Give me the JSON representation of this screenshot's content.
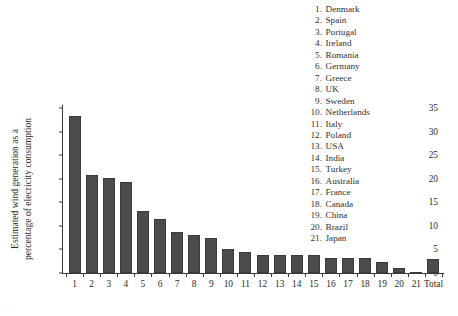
{
  "chart_data": {
    "type": "bar",
    "title": "",
    "xlabel": "",
    "ylabel": "Estimated wind generation as a percentage of elecricity consumption",
    "ylabel_lines": [
      "Estimated wind generation as a",
      "percentage of elecricity consumption"
    ],
    "categories": [
      "1",
      "2",
      "3",
      "4",
      "5",
      "6",
      "7",
      "8",
      "9",
      "10",
      "11",
      "12",
      "13",
      "14",
      "15",
      "16",
      "17",
      "18",
      "19",
      "20",
      "21",
      "Total"
    ],
    "values": [
      33.3,
      20.8,
      20.2,
      19.4,
      13.1,
      11.4,
      8.6,
      8.0,
      7.4,
      5.1,
      4.5,
      3.8,
      3.8,
      3.8,
      3.8,
      3.2,
      3.1,
      3.1,
      2.4,
      1.1,
      0.3,
      2.9
    ],
    "ylim": [
      0,
      35
    ],
    "yticks": [
      0,
      5,
      10,
      15,
      20,
      25,
      30,
      35
    ],
    "ytick_labels": [
      "0",
      "5",
      "10",
      "15",
      "20",
      "25",
      "30",
      "35"
    ],
    "grid": false,
    "legend_position": "top-right",
    "bar_color": "#4b4b4b",
    "bar_edge_color": "#3b3b3b",
    "axis_color": "#3a3a3a",
    "background_color": "#ffffff"
  },
  "legend": {
    "entries": [
      {
        "num": "1.",
        "name": "Denmark"
      },
      {
        "num": "2.",
        "name": "Spain"
      },
      {
        "num": "3.",
        "name": "Portugal"
      },
      {
        "num": "4.",
        "name": "Ireland"
      },
      {
        "num": "5.",
        "name": "Romania"
      },
      {
        "num": "6.",
        "name": "Germany"
      },
      {
        "num": "7.",
        "name": "Greece"
      },
      {
        "num": "8.",
        "name": "UK"
      },
      {
        "num": "9.",
        "name": "Sweden"
      },
      {
        "num": "10.",
        "name": "Netherlands"
      },
      {
        "num": "11.",
        "name": "Italy"
      },
      {
        "num": "12.",
        "name": "Poland"
      },
      {
        "num": "13.",
        "name": "USA"
      },
      {
        "num": "14.",
        "name": "India"
      },
      {
        "num": "15.",
        "name": "Turkey"
      },
      {
        "num": "16.",
        "name": "Australia"
      },
      {
        "num": "17.",
        "name": "France"
      },
      {
        "num": "18.",
        "name": "Canada"
      },
      {
        "num": "19.",
        "name": "China"
      },
      {
        "num": "20.",
        "name": "Brazil"
      },
      {
        "num": "21.",
        "name": "Japan"
      }
    ]
  },
  "page_artifact": {
    "bottom_left_smudge": "..."
  }
}
